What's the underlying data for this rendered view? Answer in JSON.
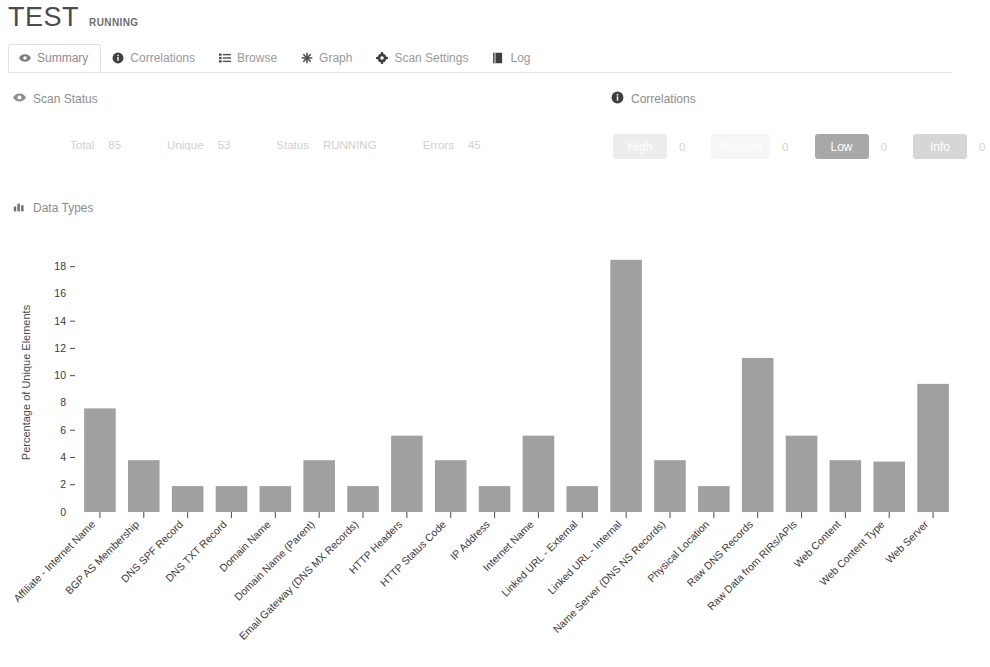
{
  "header": {
    "title": "TEST",
    "state": "RUNNING"
  },
  "tabs": [
    {
      "label": "Summary",
      "icon": "eye-icon",
      "active": true
    },
    {
      "label": "Correlations",
      "icon": "info-icon",
      "active": false
    },
    {
      "label": "Browse",
      "icon": "list-icon",
      "active": false
    },
    {
      "label": "Graph",
      "icon": "asterisk-icon",
      "active": false
    },
    {
      "label": "Scan Settings",
      "icon": "gear-icon",
      "active": false
    },
    {
      "label": "Log",
      "icon": "book-icon",
      "active": false
    }
  ],
  "scan_status": {
    "heading": "Scan Status",
    "icon": "eye-icon",
    "fields": [
      {
        "key": "Total",
        "value": "85"
      },
      {
        "key": "Unique",
        "value": "53"
      },
      {
        "key": "Status",
        "value": "RUNNING"
      },
      {
        "key": "Errors",
        "value": "45"
      }
    ]
  },
  "correlations": {
    "heading": "Correlations",
    "icon": "info-icon",
    "items": [
      {
        "label": "High",
        "count": "0",
        "color": "#ededed"
      },
      {
        "label": "Medium",
        "count": "0",
        "color": "#f6f6f6"
      },
      {
        "label": "Low",
        "count": "0",
        "color": "#a8a8a8"
      },
      {
        "label": "Info",
        "count": "0",
        "color": "#d6d6d6"
      }
    ]
  },
  "data_types": {
    "heading": "Data Types",
    "icon": "bar-chart-icon"
  },
  "chart_data": {
    "type": "bar",
    "title": "Data Types",
    "xlabel": "",
    "ylabel": "Percentage of Unique Elements",
    "ylim": [
      0,
      19
    ],
    "yticks": [
      0,
      2,
      4,
      6,
      8,
      10,
      12,
      14,
      16,
      18
    ],
    "grid": false,
    "bar_color": "#a0a0a0",
    "categories": [
      "Affiliate - Internet Name",
      "BGP AS Membership",
      "DNS SPF Record",
      "DNS TXT Record",
      "Domain Name",
      "Domain Name (Parent)",
      "Email Gateway (DNS MX Records)",
      "HTTP Headers",
      "HTTP Status Code",
      "IP Address",
      "Internet Name",
      "Linked URL - External",
      "Linked URL - Internal",
      "Name Server (DNS NS Records)",
      "Physical Location",
      "Raw DNS Records",
      "Raw Data from RIRs/APIs",
      "Web Content",
      "Web Content Type",
      "Web Server"
    ],
    "values": [
      7.6,
      3.8,
      1.9,
      1.9,
      1.9,
      3.8,
      1.9,
      5.6,
      3.8,
      1.9,
      5.6,
      1.9,
      18.5,
      3.8,
      1.9,
      11.3,
      5.6,
      3.8,
      3.7,
      9.4
    ]
  }
}
